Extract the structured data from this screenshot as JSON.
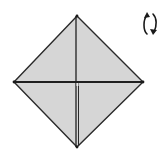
{
  "diagram": {
    "type": "origami-step",
    "shape": "square-base-diamond",
    "fill_color": "#d6d6d6",
    "line_color": "#2a2a2a",
    "background": "#ffffff",
    "vertices": {
      "top": [
        77,
        16
      ],
      "left": [
        14,
        82
      ],
      "right": [
        143,
        82
      ],
      "bottom": [
        77,
        147
      ],
      "center": [
        77,
        83
      ]
    },
    "symbols": [
      {
        "name": "turn-over-symbol",
        "meaning": "turn model over"
      }
    ]
  }
}
